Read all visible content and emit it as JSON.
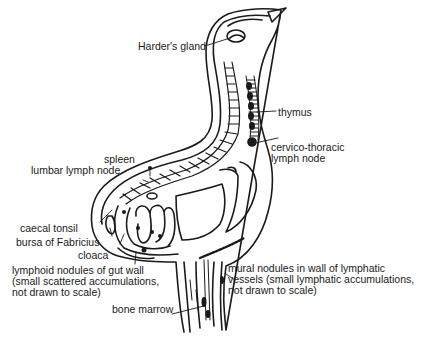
{
  "header": {
    "page_number": "",
    "running_title": ""
  },
  "figure": {
    "labels": {
      "harders_gland": "Harder's gland",
      "thymus": "thymus",
      "cervico_thoracic_1": "cervico-thoracic",
      "cervico_thoracic_2": "lymph node",
      "spleen": "spleen",
      "lumbar_lymph_node": "lumbar lymph node",
      "caecal_tonsil": "caecal tonsil",
      "bursa_of_fabricius": "bursa of Fabricius",
      "cloaca": "cloaca",
      "gut_nodules_1": "lymphoid nodules of gut wall",
      "gut_nodules_2": "(small scattered accumulations,",
      "gut_nodules_3": "not drawn to scale)",
      "mural_nodules_1": "mural nodules in wall of lymphatic",
      "mural_nodules_2": "vessels (small lymphatic accumulations,",
      "mural_nodules_3": "not drawn to scale)",
      "bone_marrow": "bone marrow"
    },
    "colors": {
      "ink": "#1a1a1a",
      "paper": "#ffffff"
    }
  }
}
